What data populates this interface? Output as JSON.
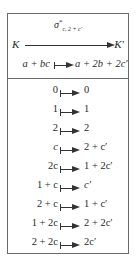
{
  "header": {
    "arrow_label": {
      "base": "σ",
      "sup": "*",
      "sub": "c, 2 + c′"
    },
    "source": "K",
    "target": "K′",
    "general_map": {
      "lhs": "a + bc",
      "rhs": "a + 2b + 2c′"
    }
  },
  "mappings": [
    {
      "lhs": "0",
      "rhs": "0"
    },
    {
      "lhs": "1",
      "rhs": "1"
    },
    {
      "lhs": "2",
      "rhs": "2"
    },
    {
      "lhs": "c",
      "rhs": "2 + c′"
    },
    {
      "lhs": "2c",
      "rhs": "1 + 2c′"
    },
    {
      "lhs": "1 + c",
      "rhs": "c′"
    },
    {
      "lhs": "2 + c",
      "rhs": "1 + c′"
    },
    {
      "lhs": "1 + 2c",
      "rhs": "2 + 2c′"
    },
    {
      "lhs": "2 + 2c",
      "rhs": "2c′"
    }
  ]
}
